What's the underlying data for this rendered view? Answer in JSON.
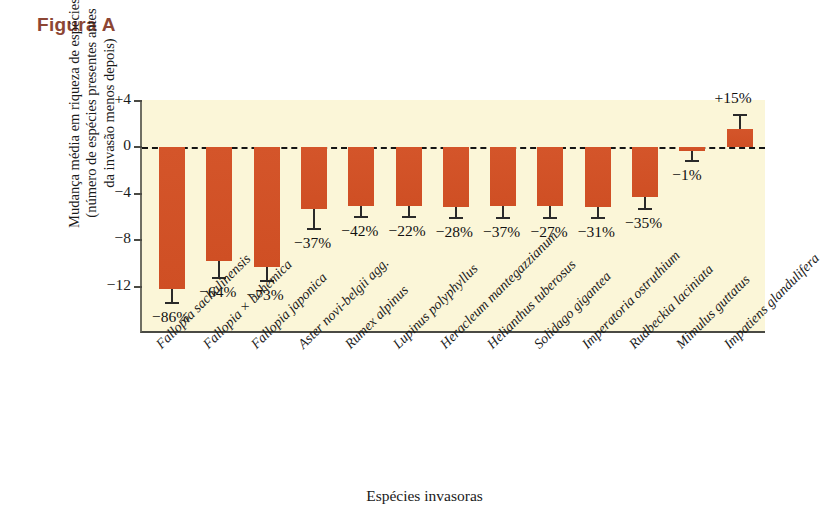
{
  "figure": {
    "title": "Figura A",
    "title_color": "#8c4634"
  },
  "chart_data": {
    "type": "bar",
    "title": "Figura A",
    "xlabel": "Espécies invasoras",
    "ylabel_lines": [
      "Mudança média em riqueza de espécies",
      "(número de espécies presentes antes",
      "da invasão menos depois)"
    ],
    "ylabel": "Mudança média em riqueza de espécies (número de espécies presentes antes da invasão menos depois)",
    "ylim": [
      -13.5,
      4
    ],
    "yticks": [
      4,
      0,
      -4,
      -8,
      -12
    ],
    "ytick_labels": [
      "+4",
      "0",
      "−4",
      "−8",
      "−12"
    ],
    "grid": false,
    "legend": null,
    "zero_reference_line": true,
    "bar_color": "#d4552a",
    "plot_background": "#fbf6d8",
    "categories": [
      "Fallopia sachalinensis",
      "Fallopia × bohemica",
      "Fallopia japonica",
      "Aster novi-belgii agg.",
      "Rumex alpinus",
      "Lupinus polyphyllus",
      "Heracleum mantegazzianum",
      "Helianthus tuberosus",
      "Solidago gigantea",
      "Imperatoria ostruthium",
      "Rudbeckia laciniata",
      "Mimulus guttatus",
      "Impatiens glandulifera"
    ],
    "values": [
      -12.2,
      -9.8,
      -10.3,
      -5.3,
      -5.0,
      -5.0,
      -5.1,
      -5.0,
      -5.0,
      -5.1,
      -4.3,
      -0.3,
      1.6
    ],
    "errors": [
      1.2,
      1.4,
      1.2,
      1.7,
      1.0,
      1.0,
      1.0,
      1.1,
      1.1,
      1.0,
      1.0,
      0.9,
      1.2
    ],
    "data_labels": [
      "−86%",
      "−64%",
      "−73%",
      "−37%",
      "−42%",
      "−22%",
      "−28%",
      "−37%",
      "−27%",
      "−31%",
      "−35%",
      "−1%",
      "+15%"
    ]
  }
}
